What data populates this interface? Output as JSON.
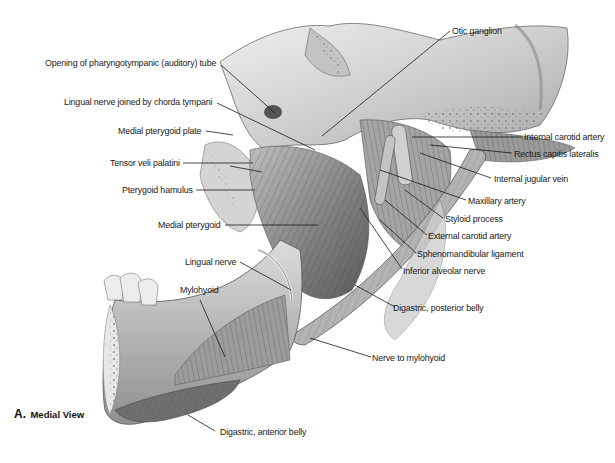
{
  "figure": {
    "caption_letter": "A.",
    "caption_text": "Medial View",
    "colors": {
      "ink": "#1a1a1a",
      "bone": "#d9d9d9",
      "muscle": "#8a8a8a",
      "background": "#ffffff"
    }
  },
  "labels_left": [
    {
      "id": "opening-pharyngotympanic-tube",
      "text": "Opening of pharyngotympanic (auditory) tube"
    },
    {
      "id": "lingual-nerve-chorda-tympani",
      "text": "Lingual nerve joined by chorda tympani"
    },
    {
      "id": "medial-pterygoid-plate",
      "text": "Medial pterygoid plate"
    },
    {
      "id": "tensor-veli-palatini",
      "text": "Tensor veli palatini"
    },
    {
      "id": "pterygoid-hamulus",
      "text": "Pterygoid hamulus"
    },
    {
      "id": "medial-pterygoid",
      "text": "Medial pterygoid"
    },
    {
      "id": "lingual-nerve",
      "text": "Lingual nerve"
    },
    {
      "id": "mylohyoid",
      "text": "Mylohyoid"
    }
  ],
  "labels_right": [
    {
      "id": "otic-ganglion",
      "text": "Otic ganglion"
    },
    {
      "id": "internal-carotid-artery",
      "text": "Internal carotid artery"
    },
    {
      "id": "rectus-capitis-lateralis",
      "text": "Rectus capitis lateralis"
    },
    {
      "id": "internal-jugular-vein",
      "text": "Internal jugular vein"
    },
    {
      "id": "maxillary-artery",
      "text": "Maxillary artery"
    },
    {
      "id": "styloid-process",
      "text": "Styloid process"
    },
    {
      "id": "external-carotid-artery",
      "text": "External carotid artery"
    },
    {
      "id": "sphenomandibular-ligament",
      "text": "Sphenomandibular ligament"
    },
    {
      "id": "inferior-alveolar-nerve",
      "text": "Inferior alveolar nerve"
    },
    {
      "id": "digastric-posterior-belly",
      "text": "Digastric, posterior belly"
    },
    {
      "id": "nerve-to-mylohyoid",
      "text": "Nerve to mylohyoid"
    },
    {
      "id": "digastric-anterior-belly",
      "text": "Digastric, anterior belly"
    }
  ]
}
